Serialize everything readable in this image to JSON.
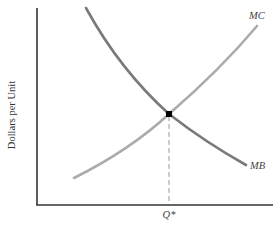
{
  "diagram": {
    "type": "supply-demand-style economics diagram",
    "y_axis_label": "Dollars per Unit",
    "x_axis_tick_label": "Q*",
    "curves": [
      {
        "id": "mc",
        "label": "MC",
        "description": "Marginal cost, upward sloping",
        "color": "#ababab"
      },
      {
        "id": "mb",
        "label": "MB",
        "description": "Marginal benefit, downward sloping",
        "color": "#7a7a7a"
      }
    ],
    "equilibrium": {
      "label": "Q*",
      "marker": "black square at intersection of MC and MB",
      "dropline": "dashed vertical line to x-axis"
    },
    "colors": {
      "axis": "#333333",
      "marker": "#000000",
      "dropline": "#9a9a9a"
    }
  }
}
